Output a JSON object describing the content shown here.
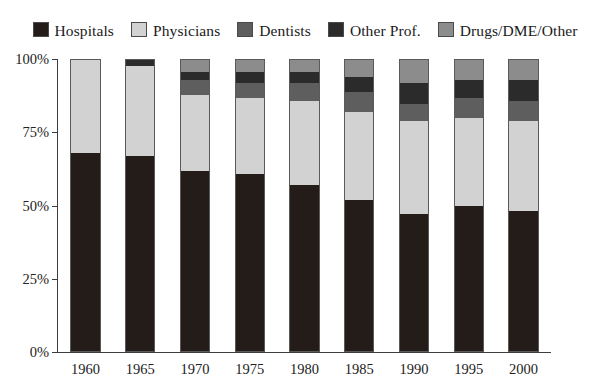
{
  "chart_data": {
    "type": "bar",
    "subtype": "stacked-percent",
    "title": "",
    "xlabel": "",
    "ylabel": "",
    "ylim": [
      0,
      100
    ],
    "ytick_labels": [
      "0%",
      "25%",
      "50%",
      "75%",
      "100%"
    ],
    "ytick_values": [
      0,
      25,
      50,
      75,
      100
    ],
    "grid": false,
    "legend_position": "top",
    "categories": [
      "1960",
      "1965",
      "1970",
      "1975",
      "1980",
      "1985",
      "1990",
      "1995",
      "2000"
    ],
    "series": [
      {
        "name": "Hospitals",
        "color": "#231c18",
        "values": [
          68,
          67,
          62,
          61,
          57,
          52,
          47,
          50,
          48
        ]
      },
      {
        "name": "Physicians",
        "color": "#d2d2d2",
        "values": [
          32,
          31,
          26,
          26,
          29,
          30,
          32,
          30,
          31
        ]
      },
      {
        "name": "Dentists",
        "color": "#5e5e5e",
        "values": [
          0,
          0,
          5,
          5,
          6,
          7,
          6,
          7,
          7
        ]
      },
      {
        "name": "Other Prof.",
        "color": "#2b2b2b",
        "values": [
          0,
          2,
          3,
          4,
          4,
          5,
          7,
          6,
          7
        ]
      },
      {
        "name": "Drugs/DME/Other",
        "color": "#8c8c8c",
        "values": [
          0,
          0,
          4,
          4,
          4,
          6,
          8,
          7,
          7
        ]
      }
    ]
  },
  "legend": {
    "items": [
      {
        "label": "Hospitals",
        "color": "#231c18"
      },
      {
        "label": "Physicians",
        "color": "#d2d2d2"
      },
      {
        "label": "Dentists",
        "color": "#5e5e5e"
      },
      {
        "label": "Other Prof.",
        "color": "#2b2b2b"
      },
      {
        "label": "Drugs/DME/Other",
        "color": "#8c8c8c"
      }
    ]
  },
  "axes": {
    "y_labels": [
      "100%",
      "75%",
      "50%",
      "25%",
      "0%"
    ],
    "x_labels": [
      "1960",
      "1965",
      "1970",
      "1975",
      "1980",
      "1985",
      "1990",
      "1995",
      "2000"
    ]
  }
}
